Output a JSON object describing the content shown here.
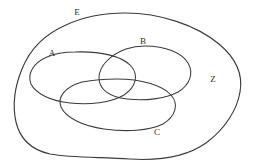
{
  "diagram": {
    "kind": "venn-euler-diagram",
    "background_color": "#ffffff",
    "stroke_color": "#3a3a3a",
    "label_color": "#2e2e2e",
    "width": 253,
    "height": 168,
    "labels": [
      {
        "id": "E",
        "text": "E",
        "x": 77,
        "y": 13,
        "role": "universal-set-label"
      },
      {
        "id": "A",
        "text": "A",
        "x": 52,
        "y": 54,
        "role": "set-label"
      },
      {
        "id": "B",
        "text": "B",
        "x": 143,
        "y": 42,
        "role": "set-label"
      },
      {
        "id": "C",
        "text": "C",
        "x": 157,
        "y": 133,
        "role": "set-label"
      },
      {
        "id": "Z",
        "text": "Z",
        "x": 213,
        "y": 80,
        "role": "region-label"
      }
    ],
    "shapes": [
      {
        "id": "outer-blob",
        "name": "universal-set-boundary",
        "label_ref": "E",
        "path": "M 125 13 C 160 13 196 25 219 44 C 238 60 243 76 240 92 C 237 110 225 129 206 143 C 186 157 160 161 130 159 C 100 157 72 158 50 154 C 32 150 20 139 16 122 C 12 104 15 86 22 69 C 30 49 45 34 66 25 C 85 16 105 13 125 13 Z"
      },
      {
        "id": "ellipse-a",
        "name": "set-a-boundary",
        "label_ref": "A",
        "path": "M 75 52 C 100 51 122 56 131 66 C 139 75 136 87 124 95 C 111 103 89 105 70 103 C 51 101 36 94 31 84 C 27 74 33 63 47 57 C 56 53 65 52 75 52 Z"
      },
      {
        "id": "ellipse-b",
        "name": "set-b-boundary",
        "label_ref": "B",
        "path": "M 145 46 C 166 46 182 53 188 63 C 194 73 190 85 178 92 C 165 99 145 101 127 99 C 109 97 99 89 99 78 C 99 66 110 55 126 49 C 132 47 139 46 145 46 Z"
      },
      {
        "id": "ellipse-c",
        "name": "set-c-boundary",
        "label_ref": "C",
        "path": "M 117 79 C 141 79 162 85 171 95 C 179 104 176 116 163 124 C 149 131 126 132 104 129 C 83 126 66 118 61 107 C 57 97 65 87 82 82 C 93 80 105 79 117 79 Z"
      }
    ]
  }
}
